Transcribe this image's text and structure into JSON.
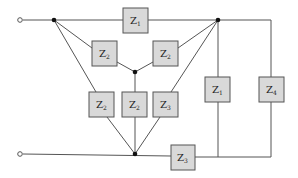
{
  "diagram": {
    "type": "circuit",
    "colors": {
      "wire": "#555555",
      "box_fill": "#d9d9d9",
      "node": "#111111",
      "background": "#ffffff"
    },
    "terminals": [
      {
        "id": "t-top",
        "x": 20,
        "y": 20
      },
      {
        "id": "t-bottom",
        "x": 20,
        "y": 154
      }
    ],
    "nodes": [
      {
        "id": "n-left",
        "x": 54,
        "y": 20
      },
      {
        "id": "n-right",
        "x": 218,
        "y": 20
      },
      {
        "id": "n-center",
        "x": 135,
        "y": 72
      },
      {
        "id": "n-bottom",
        "x": 135,
        "y": 154
      }
    ],
    "impedances": [
      {
        "id": "z-top",
        "base": "Z",
        "sub": "1",
        "x": 123,
        "y": 8
      },
      {
        "id": "z-upper-left",
        "base": "Z",
        "sub": "2",
        "x": 92,
        "y": 41
      },
      {
        "id": "z-upper-right",
        "base": "Z",
        "sub": "2",
        "x": 153,
        "y": 41
      },
      {
        "id": "z-mid-left",
        "base": "Z",
        "sub": "2",
        "x": 89,
        "y": 92
      },
      {
        "id": "z-mid-center",
        "base": "Z",
        "sub": "2",
        "x": 120,
        "y": 92
      },
      {
        "id": "z-mid-right",
        "base": "Z",
        "sub": "3",
        "x": 152,
        "y": 92
      },
      {
        "id": "z-right-1",
        "base": "Z",
        "sub": "1",
        "x": 205,
        "y": 77
      },
      {
        "id": "z-right-4",
        "base": "Z",
        "sub": "4",
        "x": 259,
        "y": 77
      },
      {
        "id": "z-bottom",
        "base": "Z",
        "sub": "3",
        "x": 171,
        "y": 145
      }
    ]
  }
}
